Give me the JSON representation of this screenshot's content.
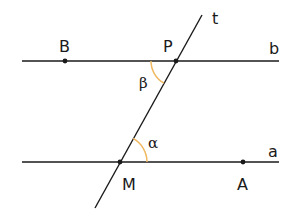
{
  "diagram": {
    "title": "",
    "colors": {
      "line": "#1a1a1a",
      "angle_arc": "#f0b860",
      "background": "#ffffff"
    },
    "lines": [
      {
        "name": "b",
        "label": "b",
        "x1": 22,
        "y1": 61,
        "x2": 279,
        "y2": 61
      },
      {
        "name": "a",
        "label": "a",
        "x1": 22,
        "y1": 162,
        "x2": 279,
        "y2": 162
      },
      {
        "name": "t",
        "label": "t",
        "x1": 202,
        "y1": 15,
        "x2": 95,
        "y2": 208
      }
    ],
    "points": [
      {
        "label": "B",
        "x": 65,
        "y": 61
      },
      {
        "label": "P",
        "x": 176,
        "y": 61
      },
      {
        "label": "M",
        "x": 120,
        "y": 162
      },
      {
        "label": "A",
        "x": 243,
        "y": 162
      }
    ],
    "angles": [
      {
        "label": "β",
        "vertex": "P",
        "description": "angle between line b (left) and transversal t (below)"
      },
      {
        "label": "α",
        "vertex": "M",
        "description": "angle between line a (right) and transversal t (above)"
      }
    ],
    "labels": {
      "t": "t",
      "b": "b",
      "a": "a",
      "B": "B",
      "P": "P",
      "M": "M",
      "A": "A",
      "beta": "β",
      "alpha": "α"
    }
  }
}
